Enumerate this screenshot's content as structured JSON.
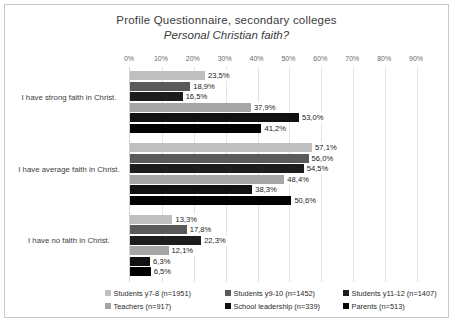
{
  "title": {
    "line1": "Profile Questionnaire, secondary colleges",
    "line2": "Personal Christian faith?"
  },
  "chart_data": {
    "type": "bar",
    "orientation": "horizontal",
    "xlabel": "",
    "ylabel": "",
    "xlim": [
      0,
      95
    ],
    "grid": true,
    "legend_position": "bottom",
    "value_suffix": "%",
    "decimal_separator": ",",
    "categories": [
      "I have strong faith in Christ.",
      "I have average faith in Christ.",
      "I have no faith in Christ."
    ],
    "xticks": [
      "0%",
      "10%",
      "20%",
      "30%",
      "40%",
      "50%",
      "60%",
      "70%",
      "80%",
      "90%"
    ],
    "xtick_values": [
      0,
      10,
      20,
      30,
      40,
      50,
      60,
      70,
      80,
      90
    ],
    "series": [
      {
        "name": "Students y7-8 (n=1951)",
        "color": "#bfbfbf",
        "values": [
          23.5,
          57.1,
          13.3
        ],
        "labels": [
          "23,5%",
          "57,1%",
          "13,3%"
        ]
      },
      {
        "name": "Students y9-10 (n=1452)",
        "color": "#5a5a5a",
        "values": [
          18.9,
          56.0,
          17.8
        ],
        "labels": [
          "18,9%",
          "56,0%",
          "17,8%"
        ]
      },
      {
        "name": "Students y11-12 (n=1407)",
        "color": "#1c1c1c",
        "values": [
          16.5,
          54.5,
          22.3
        ],
        "labels": [
          "16,5%",
          "54,5%",
          "22,3%"
        ]
      },
      {
        "name": "Teachers (n=917)",
        "color": "#a6a6a6",
        "values": [
          37.9,
          48.4,
          12.1
        ],
        "labels": [
          "37,9%",
          "48,4%",
          "12,1%"
        ]
      },
      {
        "name": "School leadership (n=339)",
        "color": "#111111",
        "values": [
          53.0,
          38.3,
          6.3
        ],
        "labels": [
          "53,0%",
          "38,3%",
          "6,3%"
        ]
      },
      {
        "name": "Parents (n=513)",
        "color": "#000000",
        "values": [
          41.2,
          50.6,
          6.5
        ],
        "labels": [
          "41,2%",
          "50,6%",
          "6,5%"
        ]
      }
    ]
  }
}
